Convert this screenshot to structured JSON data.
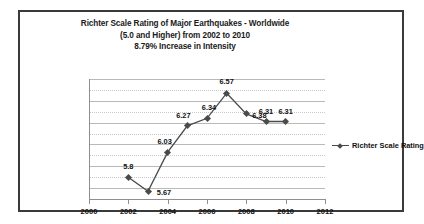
{
  "chart_data": {
    "type": "line",
    "title": "Richter Scale Rating of Major Earthquakes - Worldwide (5.0 and Higher) from 2002 to 2010 8.79% Increase in Intensity",
    "title_lines": [
      "Richter Scale Rating of Major Earthquakes - Worldwide",
      "(5.0 and Higher) from 2002 to 2010",
      "8.79% Increase in Intensity"
    ],
    "xlabel": "",
    "ylabel": "",
    "x": [
      2002,
      2003,
      2004,
      2005,
      2006,
      2007,
      2008,
      2009,
      2010
    ],
    "values": [
      5.8,
      5.67,
      6.03,
      6.27,
      6.34,
      6.57,
      6.38,
      6.31,
      6.31
    ],
    "point_labels": [
      "5.8",
      "5.67",
      "6.03",
      "6.27",
      "6.34",
      "6.57",
      "6.38",
      "6.31",
      "6.31"
    ],
    "series": [
      {
        "name": "Richter Scale Rating",
        "values": [
          5.8,
          5.67,
          6.03,
          6.27,
          6.34,
          6.57,
          6.38,
          6.31,
          6.31
        ]
      }
    ],
    "xlim": [
      2000,
      2012
    ],
    "ylim": [
      5.6,
      6.7
    ],
    "xticks": [
      "2000",
      "2002",
      "2004",
      "2006",
      "2008",
      "2010",
      "2012"
    ],
    "xtick_values": [
      2000,
      2002,
      2004,
      2006,
      2008,
      2010,
      2012
    ],
    "yticks": [
      "6.7",
      "6.6",
      "6.5",
      "6.4",
      "6.3",
      "6.2",
      "6.1",
      "6",
      "5.9",
      "5.8",
      "5.7",
      "5.6"
    ],
    "ytick_values": [
      6.7,
      6.6,
      6.5,
      6.4,
      6.3,
      6.2,
      6.1,
      6.0,
      5.9,
      5.8,
      5.7,
      5.6
    ],
    "grid": true,
    "legend_position": "right",
    "legend": [
      "Richter Scale Rating"
    ],
    "series_color": "#4a4a4a",
    "marker": "diamond"
  },
  "legend": {
    "label": "Richter Scale Rating"
  }
}
